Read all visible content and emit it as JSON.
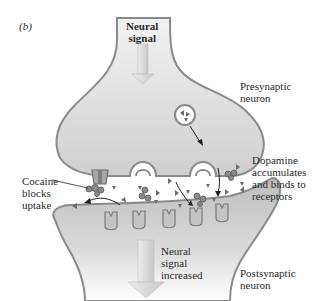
{
  "figure": {
    "panel_label": "(b)"
  },
  "labels": {
    "neural_signal_top": "Neural\nsignal",
    "presynaptic": "Presynaptic\nneuron",
    "dopamine": "Dopamine\naccumulates\nand binds to\nreceptors",
    "cocaine": "Cocaine\nblocks\nuptake",
    "neural_signal_bottom": "Neural\nsignal\nincreased",
    "postsynaptic": "Postsynaptic\nneuron"
  },
  "colors": {
    "neuron_fill": "#d9d9d9",
    "neuron_fill_dark": "#b9b9b9",
    "membrane": "#8a8a8a",
    "dopamine": "#6b6b6b",
    "arrow": "#d8d8d8",
    "text": "#2a2a2a"
  },
  "elements": {
    "receptor_count": 5,
    "vesicles": 3,
    "transporters": 1
  }
}
